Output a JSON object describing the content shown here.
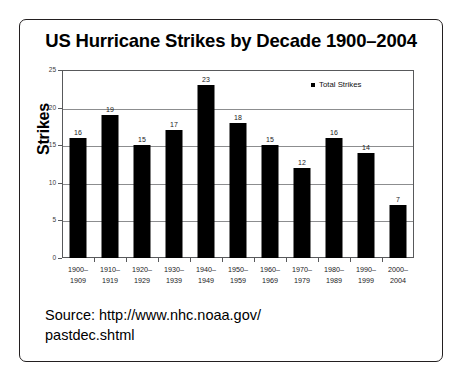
{
  "figure": {
    "source_line_1": "Source: http://www.nhc.noaa.gov/",
    "source_line_2": "pastdec.shtml"
  },
  "chart_data": {
    "type": "bar",
    "title": "US Hurricane Strikes by Decade 1900–2004",
    "xlabel": "",
    "ylabel": "Strikes",
    "ylim": [
      0,
      25
    ],
    "yticks": [
      0,
      5,
      10,
      15,
      20,
      25
    ],
    "ytick_labels": [
      "0",
      "5",
      "10",
      "15",
      "20",
      "25"
    ],
    "grid": true,
    "legend_position": "top-right",
    "legend": [
      "Total Strikes"
    ],
    "bar_color": "#000000",
    "categories": [
      "1900–1909",
      "1910–1919",
      "1920–1929",
      "1930–1939",
      "1940–1949",
      "1950–1959",
      "1960–1969",
      "1970–1979",
      "1980–1989",
      "1990–1999",
      "2000–2004"
    ],
    "category_lines": [
      [
        "1900–",
        "1909"
      ],
      [
        "1910–",
        "1919"
      ],
      [
        "1920–",
        "1929"
      ],
      [
        "1930–",
        "1939"
      ],
      [
        "1940–",
        "1949"
      ],
      [
        "1950–",
        "1959"
      ],
      [
        "1960–",
        "1969"
      ],
      [
        "1970–",
        "1979"
      ],
      [
        "1980–",
        "1989"
      ],
      [
        "1990–",
        "1999"
      ],
      [
        "2000–",
        "2004"
      ]
    ],
    "series": [
      {
        "name": "Total Strikes",
        "values": [
          16,
          19,
          15,
          17,
          23,
          18,
          15,
          12,
          16,
          14,
          7
        ]
      }
    ],
    "data_labels": [
      "16",
      "19",
      "15",
      "17",
      "23",
      "18",
      "15",
      "12",
      "16",
      "14",
      "7"
    ]
  }
}
